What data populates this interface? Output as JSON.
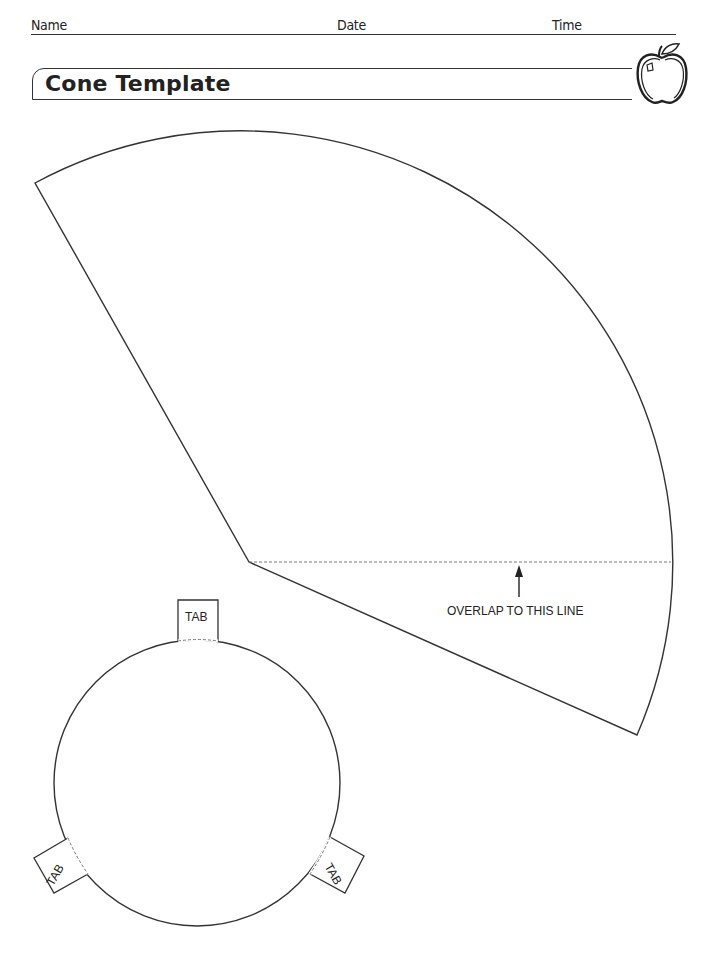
{
  "header": {
    "name_label": "Name",
    "date_label": "Date",
    "time_label": "Time"
  },
  "title": "Cone Template",
  "icons": {
    "title_icon": "apple-icon"
  },
  "cone": {
    "overlap_label": "OVERLAP TO THIS LINE"
  },
  "base": {
    "tabs": [
      {
        "label": "TAB",
        "position": "top"
      },
      {
        "label": "TAB",
        "position": "left"
      },
      {
        "label": "TAB",
        "position": "right"
      }
    ]
  },
  "colors": {
    "line": "#333333",
    "dashed": "#777777",
    "background": "#ffffff"
  }
}
